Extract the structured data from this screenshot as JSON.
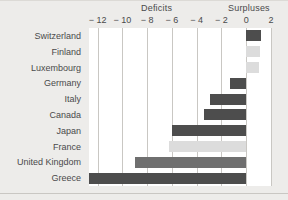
{
  "header": {
    "deficits_label": "Deficits",
    "surpluses_label": "Surpluses"
  },
  "colors": {
    "background": "#edecea",
    "plot_background": "#ffffff",
    "gridline": "#c9c7c3",
    "text": "#4a4a4a",
    "bar_dark": "#4d4d4d",
    "bar_light": "#dcdcdc"
  },
  "chart_data": {
    "type": "bar",
    "orientation": "horizontal",
    "title": "",
    "subtitle": "",
    "xlabel": "",
    "ylabel": "",
    "xlim": [
      -12.7,
      2.0
    ],
    "grid": true,
    "legend": null,
    "annotations": [
      "Deficits",
      "Surpluses"
    ],
    "xticks": [
      -12,
      -10,
      -8,
      -6,
      -4,
      -2,
      0,
      2
    ],
    "xticklabels": [
      "− 12",
      "− 10",
      "− 8",
      "− 6",
      "− 4",
      "− 2",
      "0",
      "2"
    ],
    "categories": [
      "Switzerland",
      "Finland",
      "Luxembourg",
      "Germany",
      "Italy",
      "Canada",
      "Japan",
      "France",
      "United Kingdom",
      "Greece"
    ],
    "values": [
      1.2,
      1.1,
      1.0,
      -1.3,
      -2.9,
      -3.4,
      -6.0,
      -6.2,
      -9.0,
      -12.7
    ],
    "bar_shades": [
      "dark",
      "light",
      "light",
      "dark",
      "dark",
      "dark",
      "dark",
      "light",
      "mid",
      "dark"
    ]
  }
}
